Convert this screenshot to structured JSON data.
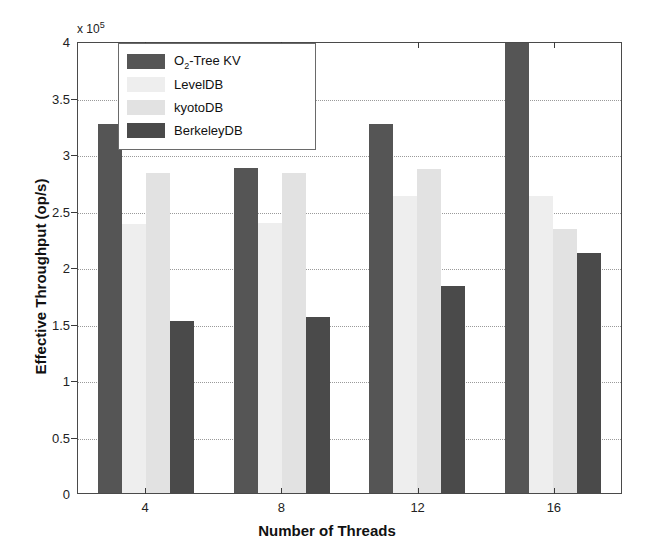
{
  "chart_data": {
    "type": "bar",
    "title": "",
    "subtitle": "",
    "xlabel": "Number of Threads",
    "ylabel": "Effective Throughput (op/s)",
    "y_exponent_label": "x 10",
    "y_exponent_value": "5",
    "categories": [
      "4",
      "8",
      "12",
      "16"
    ],
    "ylim": [
      0,
      400000
    ],
    "yticks": [
      0,
      50000,
      100000,
      150000,
      200000,
      250000,
      300000,
      350000,
      400000
    ],
    "ytick_labels": [
      "0",
      "0.5",
      "1",
      "1.5",
      "2",
      "2.5",
      "3",
      "3.5",
      "4"
    ],
    "grid": true,
    "grid_axis": "y",
    "legend_position": "upper left inside",
    "series": [
      {
        "name": "O_2-Tree KV",
        "name_base": "O",
        "name_sub": "2",
        "name_rest": "-Tree KV",
        "color": "#555555",
        "values": [
          327000,
          288000,
          327000,
          400000
        ]
      },
      {
        "name": "LevelDB",
        "name_base": "LevelDB",
        "name_sub": "",
        "name_rest": "",
        "color": "#eeeeee",
        "values": [
          238000,
          239000,
          263000,
          263000
        ]
      },
      {
        "name": "kyotoDB",
        "name_base": "kyotoDB",
        "name_sub": "",
        "name_rest": "",
        "color": "#e2e2e2",
        "values": [
          283000,
          283000,
          287000,
          234000
        ]
      },
      {
        "name": "BerkeleyDB",
        "name_base": "BerkeleyDB",
        "name_sub": "",
        "name_rest": "",
        "color": "#4a4a4a",
        "values": [
          152000,
          156000,
          183000,
          212000
        ]
      }
    ]
  }
}
